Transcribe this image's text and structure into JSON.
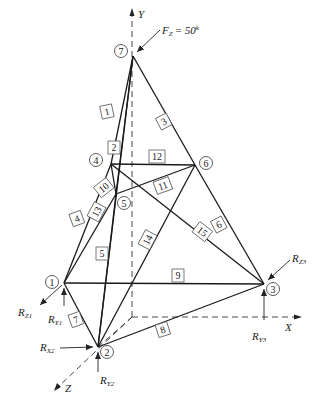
{
  "diagram": {
    "type": "space-truss",
    "load": {
      "label": "F",
      "sub": "Z",
      "value": "= 50",
      "unit": "k"
    },
    "axes": [
      {
        "id": "Y",
        "label": "Y"
      },
      {
        "id": "X",
        "label": "X"
      },
      {
        "id": "Z",
        "label": "Z"
      }
    ],
    "nodes": [
      {
        "id": "1",
        "label": "1"
      },
      {
        "id": "2",
        "label": "2"
      },
      {
        "id": "3",
        "label": "3"
      },
      {
        "id": "4",
        "label": "4"
      },
      {
        "id": "5",
        "label": "5"
      },
      {
        "id": "6",
        "label": "6"
      },
      {
        "id": "7",
        "label": "7"
      }
    ],
    "members": [
      {
        "id": "1",
        "label": "1",
        "from": "7",
        "to": "4"
      },
      {
        "id": "2",
        "label": "2",
        "from": "7",
        "to": "5"
      },
      {
        "id": "3",
        "label": "3",
        "from": "7",
        "to": "6"
      },
      {
        "id": "4",
        "label": "4",
        "from": "4",
        "to": "1"
      },
      {
        "id": "5",
        "label": "5",
        "from": "5",
        "to": "2"
      },
      {
        "id": "6",
        "label": "6",
        "from": "6",
        "to": "3"
      },
      {
        "id": "7",
        "label": "7",
        "from": "1",
        "to": "2"
      },
      {
        "id": "8",
        "label": "8",
        "from": "2",
        "to": "3"
      },
      {
        "id": "9",
        "label": "9",
        "from": "1",
        "to": "3"
      },
      {
        "id": "10",
        "label": "10",
        "from": "4",
        "to": "5"
      },
      {
        "id": "11",
        "label": "11",
        "from": "5",
        "to": "6"
      },
      {
        "id": "12",
        "label": "12",
        "from": "4",
        "to": "6"
      },
      {
        "id": "13",
        "label": "13",
        "from": "1",
        "to": "5"
      },
      {
        "id": "14",
        "label": "14",
        "from": "2",
        "to": "6"
      },
      {
        "id": "15",
        "label": "15",
        "from": "4",
        "to": "3"
      }
    ],
    "reactions": [
      {
        "id": "RZ1",
        "label": "R",
        "sub": "Z1"
      },
      {
        "id": "RY1",
        "label": "R",
        "sub": "Y1"
      },
      {
        "id": "RX2",
        "label": "R",
        "sub": "X2"
      },
      {
        "id": "RY2",
        "label": "R",
        "sub": "Y2"
      },
      {
        "id": "RZ3",
        "label": "R",
        "sub": "Z3"
      },
      {
        "id": "RY3",
        "label": "R",
        "sub": "Y3"
      }
    ]
  }
}
